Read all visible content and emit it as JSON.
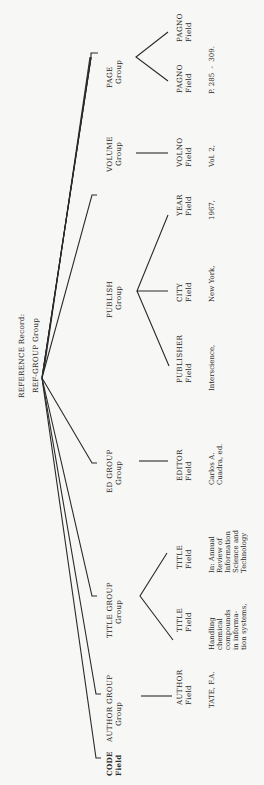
{
  "root": {
    "line1": "REFERENCE Record:",
    "line2": "REF-GROUP Group"
  },
  "nodes": {
    "code": {
      "name": "CODE",
      "type": "Field"
    },
    "author_group": {
      "name": "AUTHOR GROUP",
      "type": "Group"
    },
    "title_group": {
      "name": "TITLE GROUP",
      "type": "Group"
    },
    "ed_group": {
      "name": "ED GROUP",
      "type": "Group"
    },
    "publish": {
      "name": "PUBLISH",
      "type": "Group"
    },
    "volume": {
      "name": "VOLUME",
      "type": "Group"
    },
    "page": {
      "name": "PAGE",
      "type": "Group"
    }
  },
  "fields": {
    "author": {
      "name": "AUTHOR",
      "type": "Field"
    },
    "title1": {
      "name": "TITLE",
      "type": "Field"
    },
    "title2": {
      "name": "TITLE",
      "type": "Field"
    },
    "editor": {
      "name": "EDITOR",
      "type": "Field"
    },
    "publisher": {
      "name": "PUBLISHER",
      "type": "Field"
    },
    "city": {
      "name": "CITY",
      "type": "Field"
    },
    "year": {
      "name": "YEAR",
      "type": "Field"
    },
    "volno": {
      "name": "VOLNO",
      "type": "Field"
    },
    "pagno1": {
      "name": "PAGNO",
      "type": "Field"
    },
    "pagno2": {
      "name": "PAGNO",
      "type": "Field"
    }
  },
  "values": {
    "author": [
      "TATE, F.A."
    ],
    "title1": [
      "Handling",
      "chemical",
      "compounds",
      "in informa-",
      "tion systems,"
    ],
    "title2": [
      "In: Annual",
      "Review of",
      "Information",
      "Science and",
      "Technology"
    ],
    "editor": [
      "Carlos A.",
      "Cuadra, ed."
    ],
    "publisher": [
      "Interscience,"
    ],
    "city": [
      "New York,"
    ],
    "year": [
      "1967,"
    ],
    "volno": [
      "Vol. 2,"
    ],
    "pages": [
      "P. 285  -  309."
    ]
  }
}
